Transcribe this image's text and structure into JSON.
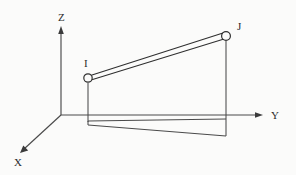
{
  "diagram": {
    "background_color": "#fbfbfa",
    "line_color": "#3a3a3a",
    "axes": [
      {
        "id": "z",
        "label": "Z",
        "label_x": 58,
        "label_y": 21,
        "direction": "up",
        "from": {
          "x": 61,
          "y": 115
        },
        "to": {
          "x": 61,
          "y": 28
        }
      },
      {
        "id": "y",
        "label": "Y",
        "label_x": 271,
        "label_y": 119,
        "direction": "right",
        "from": {
          "x": 61,
          "y": 115
        },
        "to": {
          "x": 262,
          "y": 115
        }
      },
      {
        "id": "x",
        "label": "X",
        "label_x": 14,
        "label_y": 166,
        "direction": "down-left",
        "from": {
          "x": 61,
          "y": 115
        },
        "to": {
          "x": 21,
          "y": 152
        }
      }
    ],
    "nodes": [
      {
        "id": "I",
        "label": "I",
        "cx": 88,
        "cy": 78,
        "r": 4.2,
        "label_x": 84,
        "label_y": 67
      },
      {
        "id": "J",
        "label": "J",
        "cx": 226,
        "cy": 36,
        "r": 4.4,
        "label_x": 237,
        "label_y": 30
      }
    ],
    "member": {
      "id": "member-i-j",
      "from_node": "I",
      "to_node": "J",
      "style": "double-line",
      "edges": [
        {
          "x1": 92,
          "y1": 75,
          "x2": 223,
          "y2": 33
        },
        {
          "x1": 91,
          "y1": 80,
          "x2": 224,
          "y2": 39
        }
      ]
    },
    "projection": {
      "id": "ground-projection",
      "drop_lines": [
        {
          "x1": 88,
          "y1": 83,
          "x2": 88,
          "y2": 122
        },
        {
          "x1": 226,
          "y1": 41,
          "x2": 226,
          "y2": 136
        }
      ],
      "base_top_edge": {
        "x1": 88,
        "y1": 121,
        "x2": 226,
        "y2": 119
      },
      "base_bottom_edge": {
        "x1": 88,
        "y1": 125,
        "x2": 226,
        "y2": 136
      }
    }
  }
}
